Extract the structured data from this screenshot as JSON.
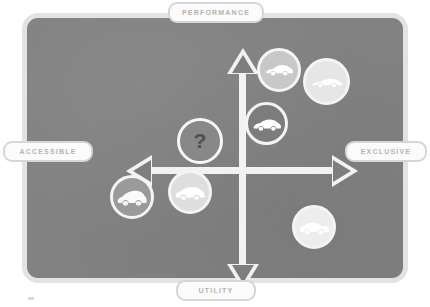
{
  "diagram": {
    "panel": {
      "background_color": "#828282",
      "border_color": "#e3e3e3"
    },
    "axes": {
      "line_color": "#f2f2f2",
      "vertical": {
        "top_label": "PERFORMANCE",
        "bottom_label": "UTILITY"
      },
      "horizontal": {
        "left_label": "ACCESSIBLE",
        "right_label": "EXCLUSIVE"
      },
      "arrows": [
        {
          "name": "arrow-up",
          "direction": "up"
        },
        {
          "name": "arrow-down",
          "direction": "down"
        },
        {
          "name": "arrow-left",
          "direction": "left"
        },
        {
          "name": "arrow-right",
          "direction": "right"
        }
      ]
    },
    "labels": {
      "performance": "PERFORMANCE",
      "utility": "UTILITY",
      "accessible": "ACCESSIBLE",
      "exclusive": "EXCLUSIVE",
      "label_text_color": "#b3b3b3",
      "label_background_color": "#fbfbfb"
    },
    "unknown_node": {
      "glyph": "?",
      "quadrant": "performance-accessible",
      "fill_color": "#888888",
      "ring_color": "#f7f7f7"
    },
    "nodes": [
      {
        "icon": "sports-car-icon",
        "quadrant": "performance-exclusive",
        "fill_color": "#c8c8c8",
        "ring_color": "#f4f4f4",
        "car_color": "#ffffff",
        "body_style": "coupe"
      },
      {
        "icon": "sports-car-icon",
        "quadrant": "performance-exclusive",
        "fill_color": "#e6e6e6",
        "ring_color": "#f6f6f6",
        "car_color": "#ffffff",
        "body_style": "roadster"
      },
      {
        "icon": "sedan-car-icon",
        "quadrant": "performance-exclusive",
        "fill_color": "#7c7c7c",
        "ring_color": "#f4f4f4",
        "car_color": "#ffffff",
        "body_style": "sedan"
      },
      {
        "icon": "suv-car-icon",
        "quadrant": "utility-accessible",
        "fill_color": "#9a9a9a",
        "ring_color": "#f2f2f2",
        "car_color": "#fafafa",
        "body_style": "suv"
      },
      {
        "icon": "van-car-icon",
        "quadrant": "utility-accessible",
        "fill_color": "#dedede",
        "ring_color": "#f6f6f6",
        "car_color": "#ffffff",
        "body_style": "minivan"
      },
      {
        "icon": "pickup-car-icon",
        "quadrant": "utility-exclusive",
        "fill_color": "#ededed",
        "ring_color": "#f8f8f8",
        "car_color": "#ffffff",
        "body_style": "pickup"
      }
    ]
  }
}
